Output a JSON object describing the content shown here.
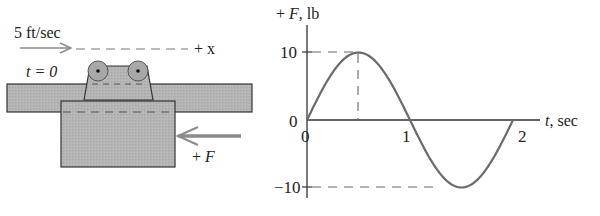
{
  "left_diagram": {
    "velocity_label": "5 ft/sec",
    "axis_label": "+ x",
    "time_label": "t = 0",
    "force_label": "+ F",
    "colors": {
      "body_fill": "#b4b4b4",
      "outline": "#333333",
      "arrow": "#8a8a8a"
    }
  },
  "chart_data": {
    "type": "line",
    "title": "",
    "xlabel": "t, sec",
    "ylabel": "+ F, lb",
    "x_ticks": [
      "0",
      "1",
      "2"
    ],
    "y_ticks": [
      "10",
      "0",
      "-10"
    ],
    "xlim": [
      0,
      2
    ],
    "ylim": [
      -10,
      10
    ],
    "grid": false,
    "function": "F = 10 sin(pi t)",
    "series": [
      {
        "name": "F(t)",
        "x": [
          0,
          0.25,
          0.5,
          0.75,
          1.0,
          1.25,
          1.5,
          1.75,
          2.0
        ],
        "values": [
          0,
          7.07,
          10,
          7.07,
          0,
          -7.07,
          -10,
          -7.07,
          0
        ]
      }
    ],
    "annotations": [
      {
        "type": "dashed-guide",
        "text": "peak 10 lb at t = 0.5 sec"
      },
      {
        "type": "dashed-guide",
        "text": "minimum -10 lb at t = 1.5 sec"
      }
    ]
  }
}
